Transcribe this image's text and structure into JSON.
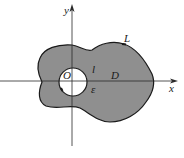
{
  "figure": {
    "colors": {
      "region_fill": "#8f8f8f",
      "boundary": "#1a1a1a",
      "axes": "#2a2a2a",
      "background": "#ffffff",
      "hole_fill": "#ffffff"
    },
    "axes": {
      "x_label": "x",
      "y_label": "y"
    },
    "labels": {
      "origin": "O",
      "outer_curve": "L",
      "inner_circle": "l",
      "region": "D",
      "radius": "ε"
    }
  }
}
